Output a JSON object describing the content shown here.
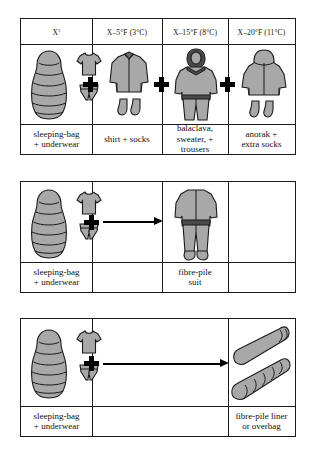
{
  "figure": {
    "type": "clothing-layer-table",
    "blocks": [
      {
        "id": "block-1",
        "headers": [
          {
            "label": "X",
            "degree": "°"
          },
          {
            "label": "X–5°F (3°C)"
          },
          {
            "label": "X–15°F (8°C)"
          },
          {
            "label": "X–20°F (11°C)"
          }
        ],
        "cells": [
          {
            "caption": "sleeping-bag\n+ underwear",
            "icons": [
              "sleeping-bag",
              "t-shirt",
              "underwear"
            ]
          },
          {
            "caption": "shirt + socks",
            "icons": [
              "shirt",
              "socks"
            ]
          },
          {
            "caption": "balaclava,\nsweater, +\ntrousers",
            "icons": [
              "balaclava-figure"
            ]
          },
          {
            "caption": "anorak +\nextra socks",
            "icons": [
              "anorak",
              "socks"
            ]
          }
        ],
        "operators": [
          "plus",
          "plus",
          "plus"
        ]
      },
      {
        "id": "block-2",
        "cells": [
          {
            "caption": "sleeping-bag\n+ underwear",
            "icons": [
              "sleeping-bag",
              "t-shirt",
              "underwear"
            ]
          },
          {
            "caption": "",
            "icons": []
          },
          {
            "caption": "fibre-pile\nsuit",
            "icons": [
              "fibre-pile-suit"
            ]
          },
          {
            "caption": "",
            "icons": []
          }
        ],
        "operators": [
          "plus",
          "arrow"
        ]
      },
      {
        "id": "block-3",
        "cells": [
          {
            "caption": "sleeping-bag\n+ underwear",
            "icons": [
              "sleeping-bag",
              "t-shirt",
              "underwear"
            ]
          },
          {
            "caption": "",
            "icons": []
          },
          {
            "caption": "fibre-pile liner\nor overbag",
            "icons": [
              "fibre-pile-liner",
              "fibre-pile-overbag"
            ]
          }
        ],
        "operators": [
          "plus",
          "arrow"
        ]
      }
    ],
    "colors": {
      "garment_fill": "#a8a8a8",
      "garment_shadow": "#6e6e6e",
      "outline": "#1b1b1b",
      "background": "#ffffff"
    }
  },
  "b1": {
    "h0_main": "X",
    "h0_sup": "°",
    "h1": "X–5°F (3°C)",
    "h2": "X–15°F (8°C)",
    "h3": "X–20°F (11°C)",
    "c0a": "sleeping-bag",
    "c0b": "+ underwear",
    "c1": "shirt + socks",
    "c2a": "balaclava,",
    "c2b": "sweater, +",
    "c2c": "trousers",
    "c3a": "anorak +",
    "c3b": "extra socks"
  },
  "b2": {
    "c0a": "sleeping-bag",
    "c0b": "+ underwear",
    "c2a": "fibre-pile",
    "c2b": "suit"
  },
  "b3": {
    "c0a": "sleeping-bag",
    "c0b": "+ underwear",
    "c2a": "fibre-pile liner",
    "c2b": "or overbag"
  }
}
